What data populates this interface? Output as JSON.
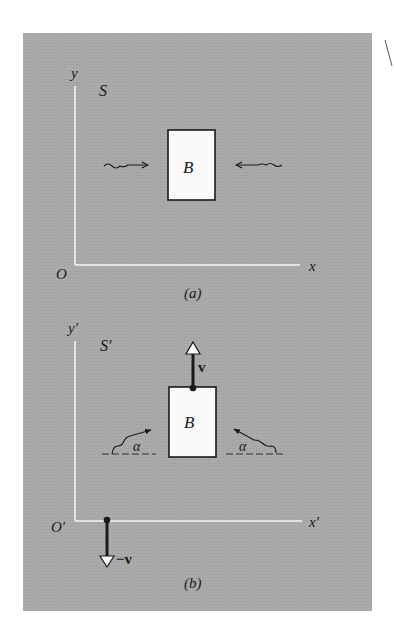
{
  "figure": {
    "background_color": "#ffffff",
    "panel_color": "#a8a8a8",
    "axis_color": "#f4f4f4",
    "box_fill": "#fafafa",
    "ink_color": "#1a1a1a"
  },
  "panel_a": {
    "caption": "(a)",
    "frame_label": "S",
    "y_axis_label": "y",
    "x_axis_label": "x",
    "origin_label": "O",
    "body_label": "B",
    "photons": [
      {
        "direction": "right",
        "description": "wavy arrow from left toward B"
      },
      {
        "direction": "left",
        "description": "wavy arrow from right toward B"
      }
    ]
  },
  "panel_b": {
    "caption": "(b)",
    "frame_label": "S′",
    "y_axis_label": "y′",
    "x_axis_label": "x′",
    "origin_label": "O′",
    "body_label": "B",
    "body_velocity_label": "v",
    "frame_velocity_label": "−v",
    "angle_label_left": "α",
    "angle_label_right": "α",
    "photons": [
      {
        "direction": "up-right",
        "angle": "α",
        "description": "wavy arrow from lower left toward B at angle α"
      },
      {
        "direction": "up-left",
        "angle": "α",
        "description": "wavy arrow from lower right toward B at angle α"
      }
    ]
  }
}
